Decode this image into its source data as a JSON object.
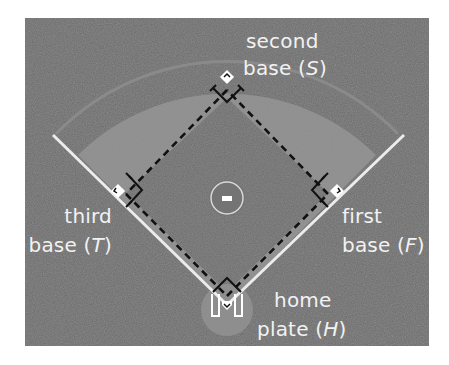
{
  "diagram": {
    "colors": {
      "background": "#ffffff",
      "grass": "#6a6a6a",
      "dirt": "#8e8e8e",
      "foul_line": "#f0f0f0",
      "dashed_path": "#1a1a1a",
      "label_text": "#f2f2f2"
    },
    "labels": {
      "second": {
        "line1": "second",
        "line2_prefix": "base (",
        "var": "S",
        "line2_suffix": ")"
      },
      "third": {
        "line1": "third",
        "line2_prefix": "base (",
        "var": "T",
        "line2_suffix": ")"
      },
      "first": {
        "line1": "first",
        "line2_prefix": "base (",
        "var": "F",
        "line2_suffix": ")"
      },
      "home": {
        "line1": "home",
        "line2_prefix": "plate (",
        "var": "H",
        "line2_suffix": ")"
      }
    },
    "elements": [
      "second-base",
      "third-base",
      "first-base",
      "home-plate",
      "pitchers-mound",
      "right-angle-marks",
      "dashed-basepaths",
      "foul-lines",
      "infield-arc"
    ]
  }
}
